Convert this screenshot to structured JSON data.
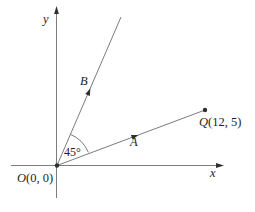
{
  "diagram": {
    "type": "coordinate-plane-angle-diagram",
    "axes": {
      "x_label": "x",
      "y_label": "y"
    },
    "origin": {
      "letter": "O",
      "coords": "(0, 0)"
    },
    "point_q": {
      "letter": "Q",
      "coords": "(12, 5)",
      "x": 12,
      "y": 5
    },
    "ray_labels": {
      "a": "A",
      "b": "B"
    },
    "angle_label": "45°",
    "angle_between_rays_deg": 45,
    "colors": {
      "line": "#7d7d7d",
      "marker": "#2f2f2f",
      "text": "#1e1e1e",
      "background": "#ffffff"
    }
  }
}
